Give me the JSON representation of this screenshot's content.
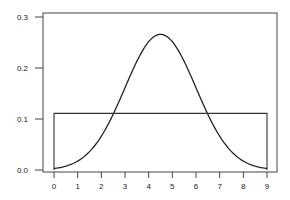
{
  "chart_data": {
    "type": "line",
    "title": "",
    "xlabel": "",
    "ylabel": "",
    "xlim": [
      0,
      9
    ],
    "ylim": [
      0.0,
      0.3
    ],
    "grid": false,
    "legend": null,
    "x_ticks": [
      "0",
      "1",
      "2",
      "3",
      "4",
      "5",
      "6",
      "7",
      "8",
      "9"
    ],
    "y_ticks": [
      "0.0",
      "0.1",
      "0.2",
      "0.3"
    ],
    "series": [
      {
        "name": "normal density",
        "description": "Bell curve, mean 4.5, sd approx 1.5",
        "x": [
          0,
          0.5,
          1,
          1.5,
          2,
          2.5,
          3,
          3.5,
          4,
          4.5,
          5,
          5.5,
          6,
          6.5,
          7,
          7.5,
          8,
          8.5,
          9
        ],
        "values": [
          0.003,
          0.007,
          0.012,
          0.018,
          0.033,
          0.055,
          0.107,
          0.171,
          0.252,
          0.266,
          0.252,
          0.171,
          0.107,
          0.055,
          0.033,
          0.018,
          0.012,
          0.007,
          0.003
        ]
      },
      {
        "name": "uniform density",
        "description": "Uniform on [0, 9], height 1/9",
        "x": [
          0,
          0,
          9,
          9
        ],
        "values": [
          0.0,
          0.111,
          0.111,
          0.0
        ]
      }
    ]
  }
}
